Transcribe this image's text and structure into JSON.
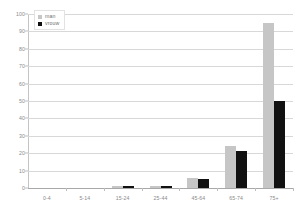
{
  "chart_data": {
    "type": "bar",
    "title": "",
    "xlabel": "",
    "ylabel": "",
    "ylim": [
      0,
      100
    ],
    "yticks": [
      0,
      10,
      20,
      30,
      40,
      50,
      60,
      70,
      80,
      90,
      100
    ],
    "grid": true,
    "legend_position": "top-left",
    "categories": [
      "0-4",
      "5-14",
      "15-24",
      "25-44",
      "45-64",
      "65-74",
      "75+"
    ],
    "series": [
      {
        "name": "man",
        "color": "#c6c6c6",
        "values": [
          0,
          0,
          1,
          1,
          6,
          24,
          95
        ]
      },
      {
        "name": "vrouw",
        "color": "#111111",
        "values": [
          0,
          0,
          1,
          1,
          5,
          21,
          50
        ]
      }
    ]
  },
  "legend": {
    "items": [
      {
        "label": "man",
        "swatch": "legend-swatch-man"
      },
      {
        "label": "vrouw",
        "swatch": "legend-swatch-vrouw"
      }
    ]
  }
}
